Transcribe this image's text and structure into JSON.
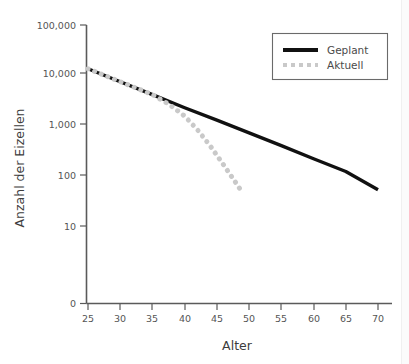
{
  "chart_data": {
    "type": "line",
    "title": "",
    "xlabel": "Alter",
    "ylabel": "Anzahl der Eizellen",
    "yscale": "log",
    "xlim": [
      25,
      70
    ],
    "ylim": [
      10,
      100000
    ],
    "grid": false,
    "legend_position": "top-right",
    "xticks": [
      25,
      30,
      35,
      40,
      45,
      50,
      55,
      60,
      65,
      70
    ],
    "xtick_labels": [
      "25",
      "30",
      "35",
      "40",
      "45",
      "50",
      "55",
      "60",
      "65",
      "70"
    ],
    "yticks": [
      100000,
      10000,
      1000,
      100,
      10,
      0
    ],
    "ytick_labels": [
      "100,000",
      "10,000",
      "1,000",
      "100",
      "10",
      "0"
    ],
    "series": [
      {
        "name": "Geplant",
        "style": "solid",
        "color": "#111111",
        "x": [
          25,
          30,
          35,
          40,
          45,
          50,
          55,
          60,
          65,
          70
        ],
        "y": [
          13000,
          7200,
          4000,
          2200,
          1250,
          700,
          390,
          215,
          120,
          52
        ]
      },
      {
        "name": "Aktuell",
        "style": "dotted",
        "color": "#c9c9c9",
        "x": [
          25,
          30,
          35,
          37.5,
          40,
          42,
          44,
          46,
          48,
          49
        ],
        "y": [
          13000,
          7200,
          4000,
          2600,
          1500,
          800,
          380,
          165,
          70,
          45
        ]
      }
    ]
  },
  "legend": {
    "items": [
      {
        "label": "Geplant",
        "color": "#111111",
        "style": "solid"
      },
      {
        "label": "Aktuell",
        "color": "#c9c9c9",
        "style": "dotted"
      }
    ]
  },
  "axes": {
    "x_title": "Alter",
    "y_title": "Anzahl der Eizellen"
  }
}
